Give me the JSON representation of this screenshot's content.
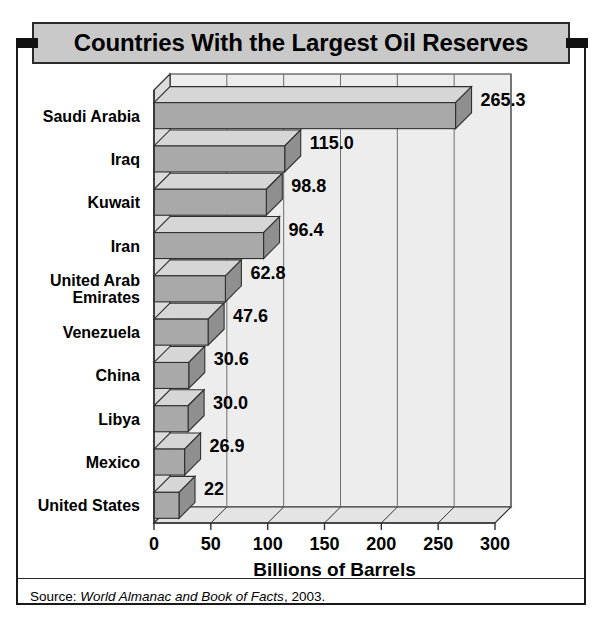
{
  "figure": {
    "title": "Countries With the Largest Oil Reserves",
    "source_prefix": "Source: ",
    "source_italic": "World Almanac and Book of Facts",
    "source_suffix": ", 2003."
  },
  "chart_data": {
    "type": "bar",
    "orientation": "horizontal",
    "style": "3d",
    "title": "Countries With the Largest Oil Reserves",
    "xlabel": "Billions of Barrels",
    "ylabel": "",
    "xlim": [
      0,
      300
    ],
    "xticks": [
      0,
      50,
      100,
      150,
      200,
      250,
      300
    ],
    "xtick_labels": [
      "0",
      "50",
      "100",
      "150",
      "200",
      "250",
      "300"
    ],
    "grid": "vertical",
    "legend": "none",
    "categories": [
      "Saudi Arabia",
      "Iraq",
      "Kuwait",
      "Iran",
      "United Arab Emirates",
      "Venezuela",
      "China",
      "Libya",
      "Mexico",
      "United States"
    ],
    "category_labels": [
      [
        "Saudi Arabia"
      ],
      [
        "Iraq"
      ],
      [
        "Kuwait"
      ],
      [
        "Iran"
      ],
      [
        "United Arab",
        "Emirates"
      ],
      [
        "Venezuela"
      ],
      [
        "China"
      ],
      [
        "Libya"
      ],
      [
        "Mexico"
      ],
      [
        "United States"
      ]
    ],
    "values": [
      265.3,
      115.0,
      98.8,
      96.4,
      62.8,
      47.6,
      30.6,
      30.0,
      26.9,
      22
    ],
    "value_labels": [
      "265.3",
      "115.0",
      "98.8",
      "96.4",
      "62.8",
      "47.6",
      "30.6",
      "30.0",
      "26.9",
      "22"
    ],
    "colors": {
      "bar_face": "#a9a9a9",
      "bar_top": "#d6d6d6",
      "bar_side": "#8f8f8f",
      "plot_background": "#ededed",
      "gridline": "#6e6e6e",
      "outline": "#303030",
      "title_banner": "#c9c9c9",
      "text": "#000000"
    }
  }
}
